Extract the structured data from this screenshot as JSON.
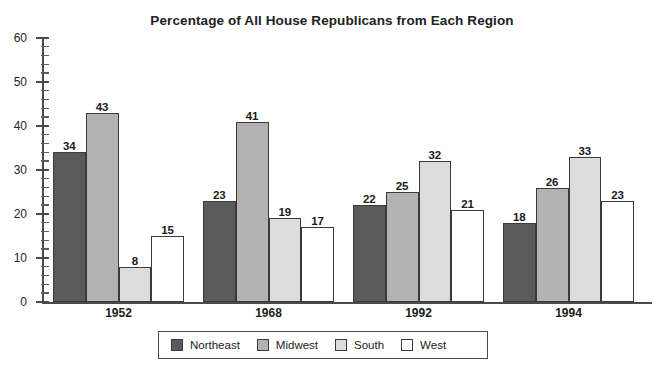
{
  "chart_data": {
    "type": "bar",
    "title": "Percentage of All House Republicans from Each Region",
    "xlabel": "",
    "ylabel": "",
    "ylim": [
      0,
      60
    ],
    "y_major_step": 10,
    "y_minor_step": 2,
    "y_ticks": [
      "0",
      "10",
      "20",
      "30",
      "40",
      "50",
      "60"
    ],
    "grid": false,
    "legend_position": "bottom",
    "categories": [
      "1952",
      "1968",
      "1992",
      "1994"
    ],
    "series": [
      {
        "name": "Northeast",
        "color": "#5a5a5a",
        "values": [
          34,
          23,
          22,
          18
        ]
      },
      {
        "name": "Midwest",
        "color": "#b2b2b2",
        "values": [
          43,
          41,
          25,
          26
        ]
      },
      {
        "name": "South",
        "color": "#dcdcdc",
        "values": [
          8,
          19,
          32,
          33
        ]
      },
      {
        "name": "West",
        "color": "#ffffff",
        "values": [
          15,
          17,
          21,
          23
        ]
      }
    ]
  },
  "legend": {
    "items": [
      {
        "label": "Northeast",
        "color": "#5a5a5a"
      },
      {
        "label": "Midwest",
        "color": "#b2b2b2"
      },
      {
        "label": "South",
        "color": "#dcdcdc"
      },
      {
        "label": "West",
        "color": "#ffffff"
      }
    ]
  }
}
